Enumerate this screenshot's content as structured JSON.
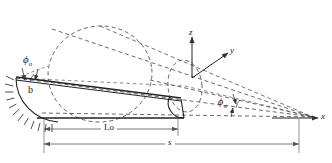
{
  "figure": {
    "type": "engineering-diagram",
    "width": 332,
    "height": 163,
    "background_color": "#ffffff",
    "line_color": "#333333",
    "dimension_color": "#555555"
  },
  "axes": {
    "x_label": "x",
    "y_label": "y",
    "z_label": "z",
    "origin_note": "axes originate at small end cross-section centre"
  },
  "angles": {
    "phi_o_symbol": "ϕ",
    "phi_o_sub": "o",
    "phi_w_symbol": "ϕ",
    "phi_w_sub": "w"
  },
  "labels": {
    "width_b": "b",
    "length_lo": "Lo",
    "length_s": "s"
  },
  "dimensions": {
    "lo_label": "Lo",
    "s_label": "s"
  },
  "support": {
    "name": "fixed-support-hatching",
    "description": "hatched arc at left root end"
  }
}
